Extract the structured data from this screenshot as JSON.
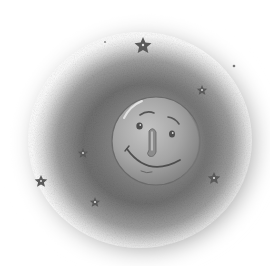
{
  "illustration": {
    "subject": "Smiling moon in a night cloud with stars",
    "background_color": "#ffffff",
    "haze_color": "#6f6f6f",
    "moon": {
      "cx": 156,
      "cy": 141,
      "r": 44,
      "fill": "#a9a9a9",
      "shadow": "#7c7c7c",
      "highlight": "#d6d6d6",
      "outline": "#6a6a6a"
    },
    "stars": [
      {
        "x": 143,
        "y": 45,
        "size": 8
      },
      {
        "x": 202,
        "y": 90,
        "size": 5
      },
      {
        "x": 83,
        "y": 153,
        "size": 5
      },
      {
        "x": 41,
        "y": 181,
        "size": 6
      },
      {
        "x": 95,
        "y": 202,
        "size": 5
      },
      {
        "x": 214,
        "y": 178,
        "size": 6
      }
    ],
    "dots": [
      {
        "x": 234,
        "y": 66
      },
      {
        "x": 105,
        "y": 42
      },
      {
        "x": 200,
        "y": 230
      }
    ],
    "star_color": "#5a5a5a"
  }
}
